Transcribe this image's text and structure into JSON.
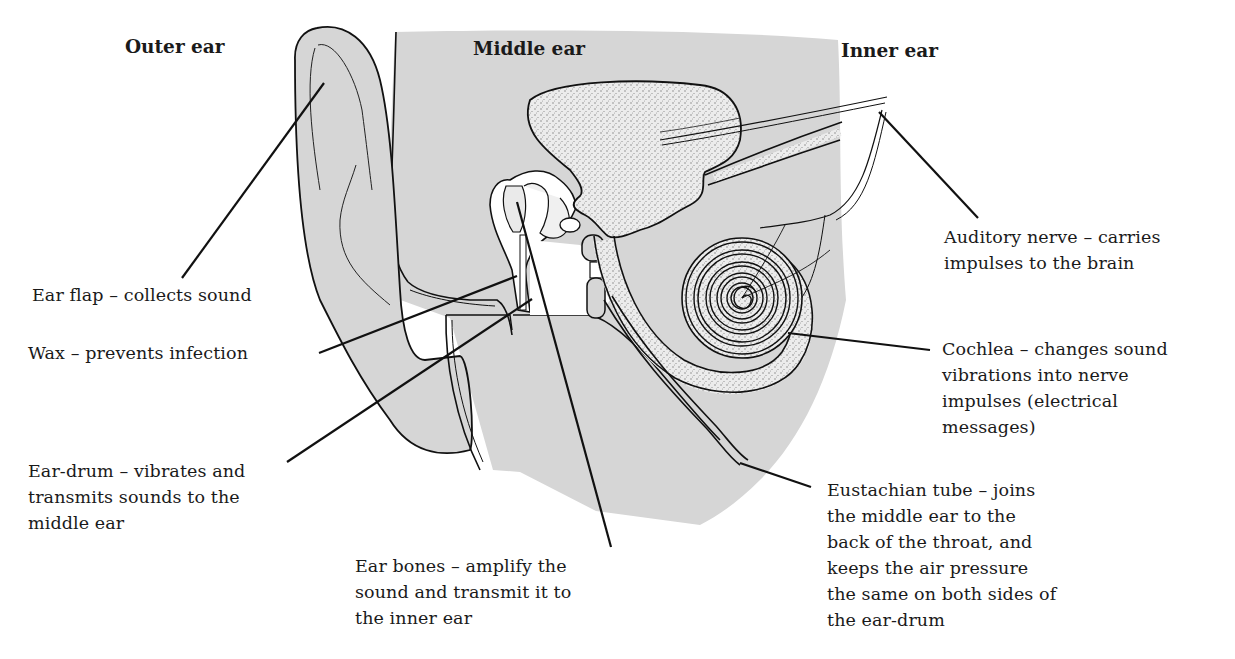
{
  "diagram": {
    "title_sections": [
      {
        "id": "outer",
        "label": "Outer ear"
      },
      {
        "id": "middle",
        "label": "Middle ear"
      },
      {
        "id": "inner",
        "label": "Inner ear"
      }
    ],
    "labels": [
      {
        "id": "ear-flap",
        "text": "Ear flap – collects sound"
      },
      {
        "id": "wax",
        "text": "Wax – prevents infection"
      },
      {
        "id": "ear-drum",
        "text": "Ear-drum – vibrates and\ntransmits sounds to the\nmiddle ear"
      },
      {
        "id": "ear-bones",
        "text": "Ear bones – amplify the\nsound and transmit it to\nthe inner ear"
      },
      {
        "id": "auditory-nerve",
        "text": "Auditory nerve – carries\nimpulses to the brain"
      },
      {
        "id": "cochlea",
        "text": "Cochlea – changes sound\nvibrations into nerve\nimpulses (electrical\nmessages)"
      },
      {
        "id": "eustachian-tube",
        "text": "Eustachian tube – joins\nthe middle ear to the\nback of the throat, and\nkeeps the air pressure\nthe same on both sides of\nthe ear-drum"
      }
    ],
    "colors": {
      "tissue_fill": "#d6d6d6",
      "bone_fill": "#e9e9e9",
      "outline": "#111111",
      "background": "#ffffff"
    }
  }
}
